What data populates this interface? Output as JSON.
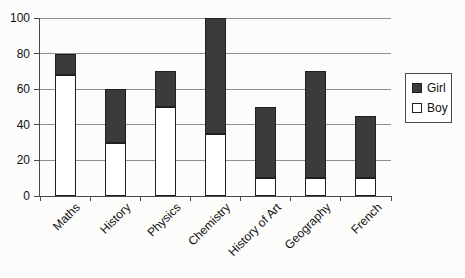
{
  "chart_data": {
    "type": "bar",
    "stacked": true,
    "title": "",
    "xlabel": "",
    "ylabel": "",
    "categories": [
      "Maths",
      "History",
      "Physics",
      "Chemistry",
      "History of Art",
      "Geography",
      "French"
    ],
    "series": [
      {
        "name": "Girl",
        "color": "#3b3b3b",
        "values": [
          12,
          30,
          20,
          65,
          40,
          60,
          35
        ]
      },
      {
        "name": "Boy",
        "color": "#ffffff",
        "values": [
          68,
          30,
          50,
          35,
          10,
          10,
          10
        ]
      }
    ],
    "stack_order_bottom_to_top": [
      "Boy",
      "Girl"
    ],
    "totals": [
      80,
      60,
      70,
      100,
      50,
      70,
      45
    ],
    "ylim": [
      0,
      100
    ],
    "yticks": [
      0,
      20,
      40,
      60,
      80,
      100
    ],
    "grid": true,
    "legend_position": "right",
    "colors": {
      "gridline": "#8f8f8f",
      "axis": "#4a4a4a",
      "bar_outline": "#1f1f1f",
      "background": "#fcfcfb",
      "text": "#111111"
    }
  },
  "legend": {
    "items": [
      {
        "label": "Girl",
        "swatch": "filled-dark"
      },
      {
        "label": "Boy",
        "swatch": "white-outline"
      }
    ]
  }
}
